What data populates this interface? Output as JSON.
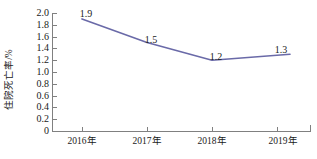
{
  "chart_data": {
    "type": "line",
    "title": "",
    "xlabel": "",
    "ylabel": "住院死亡率/%",
    "categories": [
      "2016年",
      "2017年",
      "2018年",
      "2019年"
    ],
    "values": [
      1.9,
      1.5,
      1.2,
      1.3
    ],
    "point_labels": [
      "1.9",
      "1.5",
      "1.2",
      "1.3"
    ],
    "series": [
      {
        "name": "住院死亡率",
        "values": [
          1.9,
          1.5,
          1.2,
          1.3
        ],
        "color": "#6A6AA8"
      }
    ],
    "ylim": [
      0,
      2.0
    ],
    "ytick_step": 0.2,
    "ytick_labels": [
      "2.0",
      "1.8",
      "1.6",
      "1.4",
      "1.2",
      "1.0",
      "0.8",
      "0.6",
      "0.4",
      "0.2",
      "0"
    ],
    "ytick_values": [
      2.0,
      1.8,
      1.6,
      1.4,
      1.2,
      1.0,
      0.8,
      0.6,
      0.4,
      0.2,
      0
    ],
    "grid": false,
    "legend": false,
    "legend_position": "none",
    "markers": false,
    "axis_color": "#808080",
    "text_color": "#1a1a1a",
    "background": "#ffffff"
  }
}
